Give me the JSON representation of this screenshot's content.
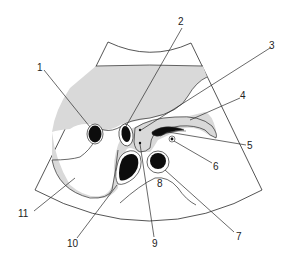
{
  "diagram": {
    "type": "ultrasound-anatomy-schematic",
    "colors": {
      "background": "#ffffff",
      "line": "#2a2a2a",
      "tissue_fill": "#d9d9d9",
      "vessel_fill": "#0d0d0d"
    },
    "labels": [
      {
        "id": "1",
        "text": "1"
      },
      {
        "id": "2",
        "text": "2"
      },
      {
        "id": "3",
        "text": "3"
      },
      {
        "id": "4",
        "text": "4"
      },
      {
        "id": "5",
        "text": "5"
      },
      {
        "id": "6",
        "text": "6"
      },
      {
        "id": "7",
        "text": "7"
      },
      {
        "id": "8",
        "text": "8"
      },
      {
        "id": "9",
        "text": "9"
      },
      {
        "id": "10",
        "text": "10"
      },
      {
        "id": "11",
        "text": "11"
      }
    ]
  }
}
